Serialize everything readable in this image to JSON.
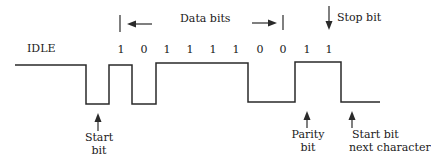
{
  "diagram": {
    "type": "serial-async-frame",
    "idle_label": "IDLE",
    "data_bits_label": "Data bits",
    "stop_bit_label": "Stop bit",
    "bits": [
      "1",
      "0",
      "1",
      "1",
      "1",
      "1",
      "0",
      "0",
      "1",
      "1"
    ],
    "annotations": {
      "start_bit": {
        "line1": "Start",
        "line2": "bit"
      },
      "parity_bit": {
        "line1": "Parity",
        "line2": "bit"
      },
      "start_bit_next": {
        "line1": "Start bit",
        "line2": "next character"
      }
    },
    "line_color": "#2a2a2a"
  }
}
